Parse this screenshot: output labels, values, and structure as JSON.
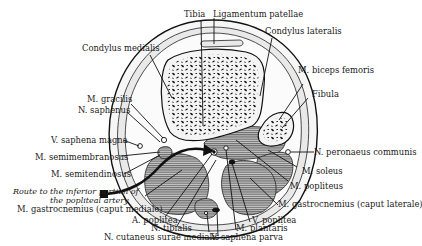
{
  "figure": {
    "labels": {
      "tibia": "Tibia",
      "ligamentum_patellae": "Ligamentum patellae",
      "condylus_medialis": "Condylus medialis",
      "condylus_lateralis": "Condylus lateralis",
      "m_biceps_femoris": "M. biceps femoris",
      "fibula": "Fibula",
      "m_gracilis": "M. gracilis",
      "n_saphenus": "N. saphenus",
      "v_saphena_magna": "V. saphena magna",
      "n_peronaeus_communis": "N. peronaeus communis",
      "m_semimembranosus": "M. semimembranosus",
      "m_soleus": "M. soleus",
      "m_semitendinosus": "M. semitendinosus",
      "m_popliteus": "M. popliteus",
      "route_line1": "Route to the inferior portion of",
      "route_line2": "the popliteal artery",
      "m_gastrocnemius_mediale": "M. gastrocnemius (caput mediale)",
      "m_gastrocnemius_laterale": "M. gastrocnemius (caput laterale)",
      "a_poplitea": "A. poplitea",
      "v_poplitea": "V. poplitea",
      "n_tibialis": "N. tibialis",
      "m_plantaris": "M. plantaris",
      "n_cutaneus_surae_medialis": "N. cutaneus surae medialis",
      "v_saphena_parva": "V. saphena parva"
    },
    "colors": {
      "ink": "#111111",
      "background": "#ffffff",
      "muscle_hatch": "#555555"
    }
  }
}
